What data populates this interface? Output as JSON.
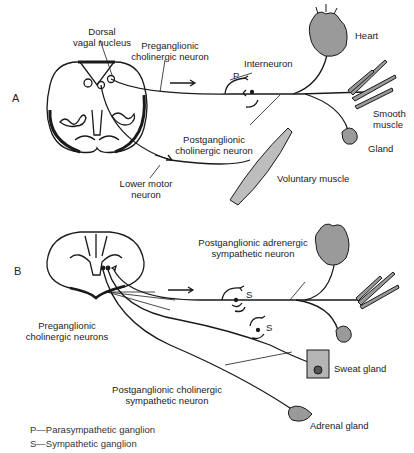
{
  "panels": {
    "a": {
      "letter": "A",
      "labels": {
        "dorsal_vagal_nucleus_1": "Dorsal",
        "dorsal_vagal_nucleus_2": "vagal nucleus",
        "preganglionic_1": "Preganglionic",
        "preganglionic_2": "cholinergic neuron",
        "interneuron": "Interneuron",
        "ganglion_p": "P",
        "heart": "Heart",
        "smooth_muscle_1": "Smooth",
        "smooth_muscle_2": "muscle",
        "gland": "Gland",
        "postganglionic_1": "Postganglionic",
        "postganglionic_2": "cholinergic neuron",
        "voluntary_muscle": "Voluntary muscle",
        "lower_motor_1": "Lower motor",
        "lower_motor_2": "neuron"
      }
    },
    "b": {
      "letter": "B",
      "labels": {
        "post_adrenergic_1": "Postganglionic adrenergic",
        "post_adrenergic_2": "sympathetic neuron",
        "ganglion_s1": "S",
        "ganglion_s2": "S",
        "preganglionic_1": "Preganglionic",
        "preganglionic_2": "cholinergic neurons",
        "sweat_gland": "Sweat gland",
        "post_cholinergic_1": "Postganglionic cholinergic",
        "post_cholinergic_2": "sympathetic neuron",
        "adrenal_gland": "Adrenal gland"
      }
    }
  },
  "legend": {
    "p": "P—Parasympathetic ganglion",
    "s": "S—Sympathetic ganglion"
  },
  "colors": {
    "line": "#1a1a1a",
    "organ_fill": "#9a9a9a",
    "gland_box": "#b5b5b5"
  }
}
